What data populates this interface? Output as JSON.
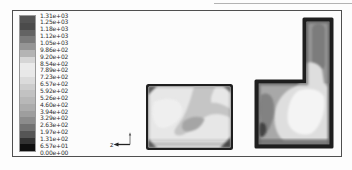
{
  "legend": {
    "tick_labels": [
      "1.31e+03",
      "1.25e+03",
      "1.18e+03",
      "1.12e+03",
      "1.05e+03",
      "9.86e+02",
      "9.20e+02",
      "8.54e+02",
      "7.89e+02",
      "7.23e+02",
      "6.57e+02",
      "5.92e+02",
      "5.26e+02",
      "4.60e+02",
      "3.94e+02",
      "3.29e+02",
      "2.63e+02",
      "1.97e+02",
      "1.31e+02",
      "6.57e+01",
      "0.00e+00"
    ],
    "band_colors": [
      "#545454",
      "#4b4b4b",
      "#636363",
      "#7a7a7a",
      "#959595",
      "#b4b4b4",
      "#d6d6d6",
      "#ebebeb",
      "#e8e8e8",
      "#dbdbdb",
      "#cdcdcd",
      "#c2c2c2",
      "#b8b8b8",
      "#acacac",
      "#9e9e9e",
      "#8c8c8c",
      "#727272",
      "#555555",
      "#323232",
      "#0f0f0f"
    ]
  },
  "axis_triad": {
    "label": "z"
  },
  "chart_data": {
    "type": "heatmap",
    "subtype": "filled-contour",
    "colormap": "grayscale, printed rainbow",
    "title": "",
    "legend_position": "left",
    "legend_tick_labels": [
      "1.31e+03",
      "1.25e+03",
      "1.18e+03",
      "1.12e+03",
      "1.05e+03",
      "9.86e+02",
      "9.20e+02",
      "8.54e+02",
      "7.89e+02",
      "7.23e+02",
      "6.57e+02",
      "5.92e+02",
      "5.26e+02",
      "4.60e+02",
      "3.94e+02",
      "3.29e+02",
      "2.63e+02",
      "1.97e+02",
      "1.31e+02",
      "6.57e+01",
      "0.00e+00"
    ],
    "contour_levels": [
      0,
      65.7,
      131,
      197,
      263,
      329,
      394,
      460,
      526,
      592,
      657,
      723,
      789,
      854,
      920,
      986,
      1051,
      1117,
      1183,
      1248,
      1314
    ],
    "value_range": [
      0,
      1314
    ],
    "panels": [
      {
        "name": "rectangular-domain",
        "shape": "rectangle",
        "description": "Mostly light mid-range field; a mid-gray band curves from the top edge down-left to a darker patch near the bottom centre, with a branch reaching the right edge; dark smudges in the corners and a faint darker band along the bottom wall."
      },
      {
        "name": "l-shaped-domain",
        "shape": "inverted-L",
        "description": "Vertical duct at top right filled mid-gray with a darker core stripe; lower chamber brightens to near-white at centre-right, darker gray along the left wall with a near-black spot at the bottom-left corner; dark rim along all walls."
      }
    ],
    "axis_triad": {
      "horizontal_axis": "z"
    }
  }
}
